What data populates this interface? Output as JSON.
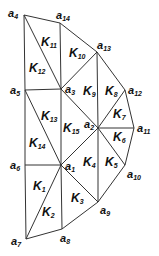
{
  "diagram": {
    "type": "triangular-mesh",
    "background": "#ffffff",
    "line_color": "#333333",
    "vertices": [
      {
        "id": "a1",
        "name": "a",
        "sub": "1",
        "x": 61,
        "y": 165,
        "lx": 65,
        "ly": 170
      },
      {
        "id": "a2",
        "name": "a",
        "sub": "2",
        "x": 98,
        "y": 128,
        "lx": 84,
        "ly": 128
      },
      {
        "id": "a3",
        "name": "a",
        "sub": "3",
        "x": 61,
        "y": 89,
        "lx": 65,
        "ly": 93
      },
      {
        "id": "a4",
        "name": "a",
        "sub": "4",
        "x": 24,
        "y": 15,
        "lx": 8,
        "ly": 17
      },
      {
        "id": "a5",
        "name": "a",
        "sub": "5",
        "x": 25,
        "y": 90,
        "lx": 10,
        "ly": 94
      },
      {
        "id": "a6",
        "name": "a",
        "sub": "6",
        "x": 25,
        "y": 165,
        "lx": 10,
        "ly": 169
      },
      {
        "id": "a7",
        "name": "a",
        "sub": "7",
        "x": 26,
        "y": 239,
        "lx": 11,
        "ly": 245
      },
      {
        "id": "a8",
        "name": "a",
        "sub": "8",
        "x": 62,
        "y": 229,
        "lx": 60,
        "ly": 242
      },
      {
        "id": "a9",
        "name": "a",
        "sub": "9",
        "x": 98,
        "y": 202,
        "lx": 100,
        "ly": 214
      },
      {
        "id": "a10",
        "name": "a",
        "sub": "10",
        "x": 125,
        "y": 165,
        "lx": 127,
        "ly": 178
      },
      {
        "id": "a11",
        "name": "a",
        "sub": "11",
        "x": 134,
        "y": 128,
        "lx": 137,
        "ly": 132
      },
      {
        "id": "a12",
        "name": "a",
        "sub": "12",
        "x": 125,
        "y": 90,
        "lx": 128,
        "ly": 94
      },
      {
        "id": "a13",
        "name": "a",
        "sub": "13",
        "x": 97,
        "y": 52,
        "lx": 97,
        "ly": 49
      },
      {
        "id": "a14",
        "name": "a",
        "sub": "14",
        "x": 60,
        "y": 23,
        "lx": 56,
        "ly": 19
      }
    ],
    "edges": [
      [
        "a4",
        "a14"
      ],
      [
        "a14",
        "a13"
      ],
      [
        "a13",
        "a12"
      ],
      [
        "a12",
        "a11"
      ],
      [
        "a11",
        "a10"
      ],
      [
        "a10",
        "a9"
      ],
      [
        "a9",
        "a8"
      ],
      [
        "a8",
        "a7"
      ],
      [
        "a7",
        "a6"
      ],
      [
        "a6",
        "a5"
      ],
      [
        "a5",
        "a4"
      ],
      [
        "a4",
        "a3"
      ],
      [
        "a14",
        "a3"
      ],
      [
        "a3",
        "a13"
      ],
      [
        "a5",
        "a3"
      ],
      [
        "a5",
        "a1"
      ],
      [
        "a3",
        "a1"
      ],
      [
        "a3",
        "a2"
      ],
      [
        "a13",
        "a2"
      ],
      [
        "a12",
        "a2"
      ],
      [
        "a11",
        "a2"
      ],
      [
        "a10",
        "a2"
      ],
      [
        "a9",
        "a2"
      ],
      [
        "a1",
        "a2"
      ],
      [
        "a6",
        "a1"
      ],
      [
        "a7",
        "a1"
      ],
      [
        "a8",
        "a1"
      ],
      [
        "a9",
        "a1"
      ]
    ],
    "elements": [
      {
        "id": "K1",
        "name": "K",
        "sub": "1",
        "x": 33,
        "y": 190
      },
      {
        "id": "K2",
        "name": "K",
        "sub": "2",
        "x": 42,
        "y": 216
      },
      {
        "id": "K3",
        "name": "K",
        "sub": "3",
        "x": 71,
        "y": 202
      },
      {
        "id": "K4",
        "name": "K",
        "sub": "4",
        "x": 83,
        "y": 166
      },
      {
        "id": "K5",
        "name": "K",
        "sub": "5",
        "x": 105,
        "y": 166
      },
      {
        "id": "K6",
        "name": "K",
        "sub": "6",
        "x": 113,
        "y": 141
      },
      {
        "id": "K7",
        "name": "K",
        "sub": "7",
        "x": 113,
        "y": 118
      },
      {
        "id": "K8",
        "name": "K",
        "sub": "8",
        "x": 105,
        "y": 95
      },
      {
        "id": "K9",
        "name": "K",
        "sub": "9",
        "x": 83,
        "y": 95
      },
      {
        "id": "K10",
        "name": "K",
        "sub": "10",
        "x": 69,
        "y": 57
      },
      {
        "id": "K11",
        "name": "K",
        "sub": "11",
        "x": 41,
        "y": 46
      },
      {
        "id": "K12",
        "name": "K",
        "sub": "12",
        "x": 29,
        "y": 72
      },
      {
        "id": "K13",
        "name": "K",
        "sub": "13",
        "x": 41,
        "y": 120
      },
      {
        "id": "K14",
        "name": "K",
        "sub": "14",
        "x": 29,
        "y": 147
      },
      {
        "id": "K15",
        "name": "K",
        "sub": "15",
        "x": 63,
        "y": 132
      }
    ]
  }
}
